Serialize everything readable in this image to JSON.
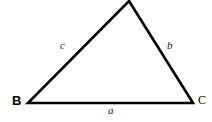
{
  "figure": {
    "kind": "geometry-diagram",
    "shape": "triangle",
    "background_color": "#ffffff",
    "stroke_color": "#000000",
    "stroke_width": 2.6,
    "width": 212,
    "height": 122
  },
  "vertices": [
    {
      "id": "apex",
      "label": "",
      "x": 129,
      "y": 1,
      "labeled": false
    },
    {
      "id": "B",
      "label": "B",
      "x": 28,
      "y": 103,
      "labeled": true,
      "label_x": 12,
      "label_y": 94
    },
    {
      "id": "C",
      "label": "C",
      "x": 193,
      "y": 103,
      "labeled": true,
      "label_x": 198,
      "label_y": 94
    }
  ],
  "sides": [
    {
      "id": "a",
      "label": "a",
      "opposite_vertex": "apex",
      "from": "B",
      "to": "C",
      "label_x": 108,
      "label_y": 105
    },
    {
      "id": "b",
      "label": "b",
      "opposite_vertex": "B",
      "from": "apex",
      "to": "C",
      "label_x": 167,
      "label_y": 40
    },
    {
      "id": "c",
      "label": "c",
      "opposite_vertex": "C",
      "from": "B",
      "to": "apex",
      "label_x": 60,
      "label_y": 40
    }
  ],
  "geometry": {
    "polygon_points": "129,1 193,103 28,103"
  }
}
